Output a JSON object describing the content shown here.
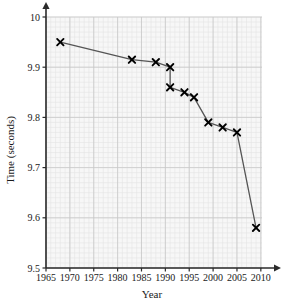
{
  "chart_data": {
    "type": "line",
    "title": "",
    "subtitle": "",
    "xlabel": "Year",
    "ylabel": "Time (seconds)",
    "xlim": [
      1965,
      2011.5
    ],
    "ylim": [
      9.5,
      10.0
    ],
    "xticks": [
      1965,
      1970,
      1975,
      1980,
      1985,
      1990,
      1995,
      2000,
      2005,
      2010
    ],
    "xtick_labels": [
      "1965",
      "1970",
      "1975",
      "1980",
      "1985",
      "1990",
      "1995",
      "2000",
      "2005",
      "2010"
    ],
    "yticks": [
      9.5,
      9.6,
      9.7,
      9.8,
      9.9,
      10.0
    ],
    "ytick_labels": [
      "9.5",
      "9.6",
      "9.7",
      "9.8",
      "9.9",
      "10"
    ],
    "grid": true,
    "grid_major_step_x": 5,
    "grid_major_step_y": 0.1,
    "grid_minor_step_x": 1,
    "grid_minor_step_y": 0.01,
    "legend": false,
    "marker": "x",
    "line_color": "#555555",
    "marker_color": "#000000",
    "grid_major_color": "#c8c8c8",
    "grid_minor_color": "#e4e4e4",
    "plot_background": "#f7f7f7",
    "axis_color": "#2b2b2b",
    "series": [
      {
        "name": "100 m world record",
        "x": [
          1968,
          1983,
          1988,
          1991,
          1991,
          1994,
          1996,
          1999,
          2002,
          2005,
          2009
        ],
        "values": [
          9.95,
          9.915,
          9.91,
          9.9,
          9.86,
          9.85,
          9.84,
          9.79,
          9.78,
          9.77,
          9.58
        ],
        "points": [
          {
            "year": 1968,
            "time": 9.95
          },
          {
            "year": 1983,
            "time": 9.915
          },
          {
            "year": 1988,
            "time": 9.91
          },
          {
            "year": 1991,
            "time": 9.9
          },
          {
            "year": 1991,
            "time": 9.86
          },
          {
            "year": 1994,
            "time": 9.85
          },
          {
            "year": 1996,
            "time": 9.84
          },
          {
            "year": 1999,
            "time": 9.79
          },
          {
            "year": 2002,
            "time": 9.78
          },
          {
            "year": 2005,
            "time": 9.77
          },
          {
            "year": 2009,
            "time": 9.58
          }
        ]
      }
    ]
  }
}
